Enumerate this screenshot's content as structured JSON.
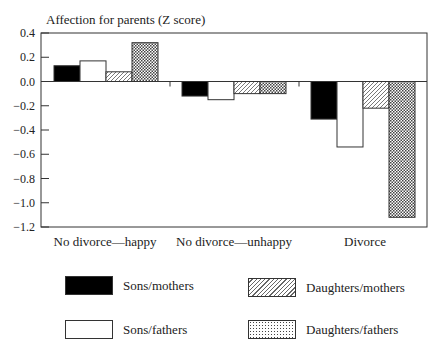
{
  "chart_data": {
    "type": "bar",
    "title": "",
    "ylabel": "Affection for parents (Z score)",
    "xlabel": "",
    "ylim": [
      -1.2,
      0.4
    ],
    "yticks": [
      "0.4",
      "0.2",
      "0.0",
      "-0.2",
      "-0.4",
      "-0.6",
      "-0.8",
      "-1.0",
      "-1.2"
    ],
    "categories": [
      "No divorce—happy",
      "No divorce—unhappy",
      "Divorce"
    ],
    "series": [
      {
        "name": "Sons/mothers",
        "pattern": "solid-black",
        "values": [
          0.13,
          -0.12,
          -0.31
        ]
      },
      {
        "name": "Sons/fathers",
        "pattern": "white",
        "values": [
          0.17,
          -0.15,
          -0.54
        ]
      },
      {
        "name": "Daughters/mothers",
        "pattern": "diagonal-hatch",
        "values": [
          0.08,
          -0.1,
          -0.22
        ]
      },
      {
        "name": "Daughters/fathers",
        "pattern": "cross-hatch",
        "values": [
          0.32,
          -0.1,
          -1.12
        ]
      }
    ],
    "grid": false,
    "legend_position": "bottom"
  },
  "legend": {
    "items": [
      {
        "label": "Sons/mothers"
      },
      {
        "label": "Daughters/mothers"
      },
      {
        "label": "Sons/fathers"
      },
      {
        "label": "Daughters/fathers"
      }
    ]
  }
}
